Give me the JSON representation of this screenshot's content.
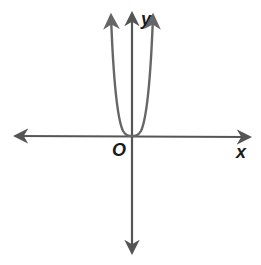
{
  "figure": {
    "type": "coordinate-graph",
    "labels": {
      "y_axis": "y",
      "x_axis": "x",
      "origin": "O"
    },
    "colors": {
      "axis": "#555555",
      "curve": "#666666",
      "text": "#1a1a1a",
      "background": "#ffffff"
    },
    "axes": {
      "x": {
        "arrows": "both"
      },
      "y": {
        "arrows": "both"
      }
    },
    "curve": {
      "shape": "U-shaped, flattened at vertex",
      "vertex": [
        0,
        0
      ],
      "end_behavior": "both ends rise to +infinity",
      "arrows": "both ends"
    }
  }
}
